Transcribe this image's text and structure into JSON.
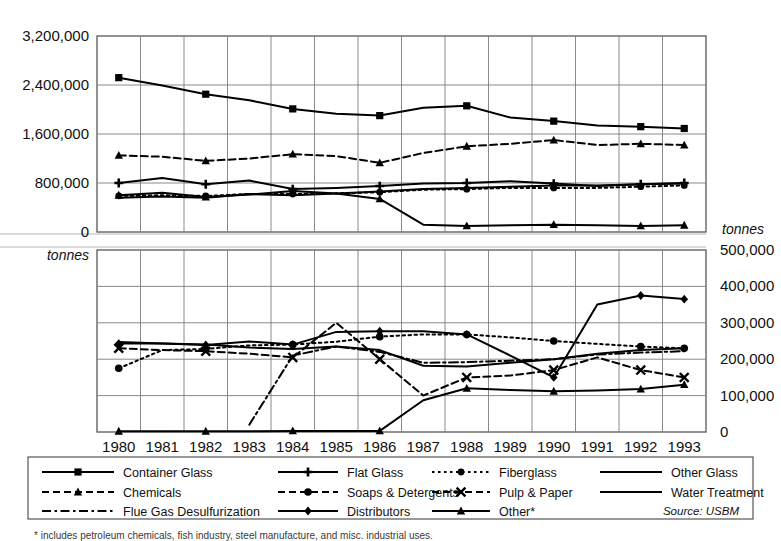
{
  "title": "Soda ash consumption in the United States",
  "footnote": "* includes petroleum chemicals, fish industry, steel manufacture, and misc. industrial uses.",
  "source_note": "Source: USBM",
  "axes": {
    "left_unit": "tonnes",
    "right_unit": "tonnes",
    "left_ticks": [
      "3,200,000",
      "2,400,000",
      "1,600,000",
      "800,000",
      "0"
    ],
    "left_tick_values": [
      3200000,
      2400000,
      1600000,
      800000,
      0
    ],
    "right_ticks": [
      "500,000",
      "400,000",
      "300,000",
      "200,000",
      "100,000",
      "0"
    ],
    "right_tick_values": [
      500000,
      400000,
      300000,
      200000,
      100000,
      0
    ],
    "years": [
      "1980",
      "1981",
      "1982",
      "1983",
      "1984",
      "1985",
      "1986",
      "1987",
      "1988",
      "1989",
      "1990",
      "1991",
      "1992",
      "1993"
    ]
  },
  "legend": {
    "entries": [
      {
        "label": "Container Glass",
        "marker": "square",
        "dash": "none",
        "panel": "upper"
      },
      {
        "label": "Flat Glass",
        "marker": "plus",
        "dash": "none",
        "panel": "upper"
      },
      {
        "label": "Fiberglass",
        "marker": "dot-big",
        "dash": "dotted",
        "panel": "upper"
      },
      {
        "label": "Other Glass",
        "marker": "none",
        "dash": "none",
        "panel": "upper"
      },
      {
        "label": "Chemicals",
        "marker": "triangle",
        "dash": "dashed",
        "panel": "upper"
      },
      {
        "label": "Soaps & Detergents",
        "marker": "circle",
        "dash": "dashed",
        "panel": "lower"
      },
      {
        "label": "Pulp & Paper",
        "marker": "cross",
        "dash": "dashed",
        "panel": "lower"
      },
      {
        "label": "Water Treatment",
        "marker": "none",
        "dash": "none",
        "panel": "lower"
      },
      {
        "label": "Flue Gas Desulfurization",
        "marker": "none",
        "dash": "dashdot",
        "panel": "lower"
      },
      {
        "label": "Distributors",
        "marker": "diamond",
        "dash": "none",
        "panel": "lower"
      },
      {
        "label": "Other*",
        "marker": "triangle",
        "dash": "none",
        "panel": "lower"
      }
    ]
  },
  "chart_data": {
    "type": "line",
    "title": "Soda ash consumption in the United States",
    "xlabel": "",
    "ylabel": "tonnes",
    "x": [
      1980,
      1981,
      1982,
      1983,
      1984,
      1985,
      1986,
      1987,
      1988,
      1989,
      1990,
      1991,
      1992,
      1993
    ],
    "panels": [
      {
        "name": "upper",
        "ylim": [
          0,
          3200000
        ],
        "ylabel": "tonnes",
        "yticks": [
          0,
          800000,
          1600000,
          2400000,
          3200000
        ],
        "series": [
          {
            "name": "Container Glass",
            "marker": "square",
            "dash": "none",
            "values": [
              2520000,
              2390000,
              2250000,
              2150000,
              2010000,
              1930000,
              1900000,
              2030000,
              2060000,
              1870000,
              1810000,
              1740000,
              1720000,
              1690000
            ]
          },
          {
            "name": "Chemicals",
            "marker": "triangle",
            "dash": "dashed",
            "values": [
              1250000,
              1230000,
              1160000,
              1200000,
              1270000,
              1240000,
              1130000,
              1290000,
              1400000,
              1440000,
              1500000,
              1420000,
              1440000,
              1420000
            ]
          },
          {
            "name": "Flat Glass",
            "marker": "plus",
            "dash": "none",
            "values": [
              800000,
              880000,
              780000,
              840000,
              700000,
              720000,
              750000,
              790000,
              800000,
              830000,
              790000,
              750000,
              780000,
              800000
            ]
          },
          {
            "name": "Fiberglass",
            "marker": "dot-big",
            "dash": "dotted",
            "values": [
              590000,
              600000,
              590000,
              620000,
              620000,
              630000,
              650000,
              690000,
              700000,
              720000,
              720000,
              720000,
              740000,
              760000
            ]
          },
          {
            "name": "Other Glass",
            "marker": "none",
            "dash": "none",
            "values": [
              560000,
              580000,
              560000,
              620000,
              600000,
              630000,
              660000,
              700000,
              720000,
              740000,
              760000,
              760000,
              780000,
              790000
            ]
          },
          {
            "name": "Other*",
            "marker": "triangle",
            "dash": "none",
            "values": [
              600000,
              640000,
              570000,
              610000,
              670000,
              630000,
              540000,
              120000,
              100000,
              110000,
              120000,
              110000,
              100000,
              110000
            ]
          }
        ]
      },
      {
        "name": "lower",
        "ylim": [
          0,
          500000
        ],
        "ylabel": "tonnes",
        "yticks": [
          0,
          100000,
          200000,
          300000,
          400000,
          500000
        ],
        "series": [
          {
            "name": "Distributors",
            "marker": "diamond",
            "dash": "none",
            "values": [
              243000,
              243000,
              239000,
              249000,
              240000,
              275000,
              277000,
              277000,
              268000,
              210000,
              150000,
              350000,
              375000,
              365000
            ]
          },
          {
            "name": "Soaps & Detergents",
            "marker": "circle",
            "dash": "dotted",
            "values": [
              175000,
              225000,
              228000,
              238000,
              240000,
              248000,
              262000,
              268000,
              268000,
              260000,
              250000,
              242000,
              235000,
              230000
            ]
          },
          {
            "name": "Pulp & Paper",
            "marker": "cross",
            "dash": "dashed",
            "values": [
              230000,
              225000,
              222000,
              215000,
              205000,
              300000,
              200000,
              100000,
              150000,
              155000,
              170000,
              205000,
              170000,
              150000
            ]
          },
          {
            "name": "Water Treatment",
            "marker": "none",
            "dash": "none",
            "values": [
              247000,
              243000,
              240000,
              232000,
              228000,
              235000,
              225000,
              182000,
              180000,
              190000,
              200000,
              215000,
              225000,
              230000
            ]
          },
          {
            "name": "Flue Gas Desulfurization",
            "marker": "none",
            "dash": "dashdot",
            "values": [
              null,
              null,
              null,
              20000,
              210000,
              235000,
              220000,
              190000,
              192000,
              196000,
              200000,
              213000,
              218000,
              222000
            ]
          },
          {
            "name": "Other*",
            "marker": "triangle",
            "dash": "none",
            "values": [
              2000,
              2000,
              2000,
              2000,
              3000,
              3000,
              3000,
              87000,
              120000,
              115000,
              112000,
              114000,
              118000,
              130000
            ]
          }
        ]
      }
    ]
  }
}
